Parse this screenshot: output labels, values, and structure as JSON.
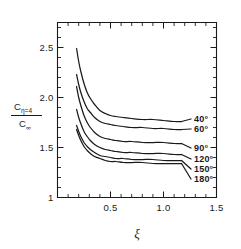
{
  "chart_data": {
    "type": "line",
    "title": "",
    "xlabel": "ξ",
    "ylabel_numerator": "C",
    "ylabel_numerator_sub": "η=4",
    "ylabel_denominator": "C",
    "ylabel_denominator_sub": "∞",
    "xlim": [
      0.0,
      1.5
    ],
    "ylim": [
      1.0,
      2.75
    ],
    "xticks": [
      0.0,
      0.5,
      1.0,
      1.5
    ],
    "xticklabels": [
      "",
      "0.5",
      "1.0",
      "1.5"
    ],
    "xticks_minor": [
      0.1,
      0.2,
      0.3,
      0.4,
      0.6,
      0.7,
      0.8,
      0.9,
      1.1,
      1.2,
      1.3,
      1.4
    ],
    "yticks": [
      1.0,
      1.5,
      2.0,
      2.5
    ],
    "yticklabels": [
      "1",
      "1.5",
      "2.0",
      "2.5"
    ],
    "yticks_minor": [
      1.1,
      1.2,
      1.3,
      1.4,
      1.6,
      1.7,
      1.8,
      1.9,
      2.1,
      2.2,
      2.3,
      2.4,
      2.6,
      2.7
    ],
    "grid": false,
    "legend_position": "right-inline",
    "line_color": "#1a1a1a",
    "series": [
      {
        "name": "40°",
        "label": "40°",
        "asymptote": 1.76,
        "x": [
          0.18,
          0.2,
          0.22,
          0.25,
          0.28,
          0.31,
          0.35,
          0.4,
          0.45,
          0.5,
          0.55,
          0.62,
          0.7,
          0.8,
          0.9,
          1.0,
          1.1,
          1.17
        ],
        "values": [
          2.49,
          2.36,
          2.26,
          2.14,
          2.05,
          1.99,
          1.93,
          1.87,
          1.84,
          1.82,
          1.81,
          1.8,
          1.79,
          1.78,
          1.78,
          1.77,
          1.76,
          1.76
        ]
      },
      {
        "name": "60°",
        "label": "60°",
        "asymptote": 1.68,
        "x": [
          0.18,
          0.2,
          0.22,
          0.25,
          0.28,
          0.31,
          0.35,
          0.4,
          0.45,
          0.5,
          0.55,
          0.62,
          0.7,
          0.8,
          0.9,
          1.0,
          1.1,
          1.17
        ],
        "values": [
          2.23,
          2.13,
          2.05,
          1.96,
          1.89,
          1.85,
          1.8,
          1.76,
          1.74,
          1.73,
          1.72,
          1.71,
          1.7,
          1.7,
          1.69,
          1.69,
          1.68,
          1.68
        ]
      },
      {
        "name": "90°",
        "label": "90°",
        "asymptote": 1.54,
        "x": [
          0.18,
          0.2,
          0.22,
          0.25,
          0.28,
          0.31,
          0.35,
          0.4,
          0.45,
          0.5,
          0.55,
          0.62,
          0.7,
          0.8,
          0.9,
          1.0,
          1.1,
          1.17
        ],
        "values": [
          2.11,
          2.0,
          1.92,
          1.82,
          1.75,
          1.7,
          1.65,
          1.61,
          1.59,
          1.58,
          1.57,
          1.56,
          1.56,
          1.55,
          1.55,
          1.55,
          1.54,
          1.54
        ]
      },
      {
        "name": "120°",
        "label": "120°",
        "asymptote": 1.43,
        "x": [
          0.18,
          0.2,
          0.22,
          0.25,
          0.28,
          0.31,
          0.35,
          0.4,
          0.45,
          0.5,
          0.55,
          0.62,
          0.7,
          0.8,
          0.9,
          1.0,
          1.1,
          1.17
        ],
        "values": [
          1.88,
          1.8,
          1.74,
          1.66,
          1.61,
          1.57,
          1.53,
          1.5,
          1.48,
          1.47,
          1.46,
          1.45,
          1.45,
          1.44,
          1.44,
          1.44,
          1.43,
          1.43
        ]
      },
      {
        "name": "150°",
        "label": "150°",
        "asymptote": 1.37,
        "x": [
          0.18,
          0.2,
          0.22,
          0.25,
          0.28,
          0.31,
          0.35,
          0.4,
          0.45,
          0.5,
          0.55,
          0.62,
          0.7,
          0.8,
          0.9,
          1.0,
          1.1,
          1.17
        ],
        "values": [
          1.72,
          1.66,
          1.61,
          1.55,
          1.51,
          1.48,
          1.45,
          1.42,
          1.41,
          1.4,
          1.39,
          1.39,
          1.38,
          1.38,
          1.38,
          1.37,
          1.37,
          1.37
        ]
      },
      {
        "name": "180°",
        "label": "180°",
        "asymptote": 1.34,
        "x": [
          0.18,
          0.2,
          0.22,
          0.25,
          0.28,
          0.31,
          0.35,
          0.4,
          0.45,
          0.5,
          0.55,
          0.62,
          0.7,
          0.8,
          0.9,
          1.0,
          1.1,
          1.17
        ],
        "values": [
          1.68,
          1.62,
          1.57,
          1.51,
          1.47,
          1.44,
          1.41,
          1.39,
          1.37,
          1.36,
          1.36,
          1.35,
          1.35,
          1.35,
          1.34,
          1.34,
          1.34,
          1.34
        ]
      }
    ]
  }
}
